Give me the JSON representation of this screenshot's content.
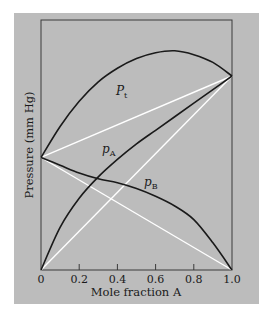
{
  "chart_data": {
    "type": "line",
    "title": "",
    "xlabel": "Mole fraction A",
    "ylabel": "Pressure (mm Hg)",
    "xlim": [
      0,
      1.0
    ],
    "ylim": [
      0,
      100
    ],
    "x_ticks": [
      "0",
      "0.2",
      "0.4",
      "0.6",
      "0.8",
      "1.0"
    ],
    "y_ticks": [],
    "grid": false,
    "legend": null,
    "colors": {
      "background": "#bcbcbc",
      "curves": "#1a1a1a",
      "ideal_lines": "#ffffff",
      "frame": "#3a3a3a"
    },
    "series": [
      {
        "name": "P_t",
        "label": "P",
        "subscript": "t",
        "style": "solid-black",
        "x": [
          0,
          0.1,
          0.2,
          0.3,
          0.4,
          0.5,
          0.6,
          0.7,
          0.8,
          0.9,
          1.0
        ],
        "values": [
          58,
          74,
          87,
          97,
          104,
          109,
          112,
          113,
          111,
          107,
          100
        ]
      },
      {
        "name": "p_A",
        "label": "p",
        "subscript": "A",
        "style": "solid-black",
        "x": [
          0,
          0.1,
          0.2,
          0.3,
          0.4,
          0.5,
          0.6,
          0.7,
          0.8,
          0.9,
          1.0
        ],
        "values": [
          0,
          22,
          37,
          48,
          57,
          65,
          72,
          79,
          86,
          93,
          100
        ]
      },
      {
        "name": "p_B",
        "label": "p",
        "subscript": "B",
        "style": "solid-black",
        "x": [
          0,
          0.1,
          0.2,
          0.3,
          0.4,
          0.5,
          0.6,
          0.7,
          0.8,
          0.9,
          1.0
        ],
        "values": [
          58,
          54,
          50,
          47,
          45,
          42,
          38,
          33,
          26,
          14,
          0
        ]
      },
      {
        "name": "ideal total (Raoult)",
        "style": "white-line",
        "x": [
          0,
          1.0
        ],
        "values": [
          58,
          100
        ]
      },
      {
        "name": "ideal p_A (Raoult)",
        "style": "white-line",
        "x": [
          0,
          1.0
        ],
        "values": [
          0,
          100
        ]
      },
      {
        "name": "ideal p_B (Raoult)",
        "style": "white-line",
        "x": [
          0,
          1.0
        ],
        "values": [
          58,
          0
        ]
      }
    ],
    "annotations": [
      {
        "text": "P_t",
        "x": 0.45,
        "y": 92
      },
      {
        "text": "p_A",
        "x": 0.34,
        "y": 60
      },
      {
        "text": "p_B",
        "x": 0.59,
        "y": 44
      }
    ]
  },
  "labels": {
    "xlabel": "Mole fraction A",
    "ylabel": "Pressure (mm Hg)",
    "pt_main": "P",
    "pt_sub": "t",
    "pa_main": "p",
    "pa_sub": "A",
    "pb_main": "p",
    "pb_sub": "B",
    "ticks": [
      "0",
      "0.2",
      "0.4",
      "0.6",
      "0.8",
      "1.0"
    ]
  }
}
